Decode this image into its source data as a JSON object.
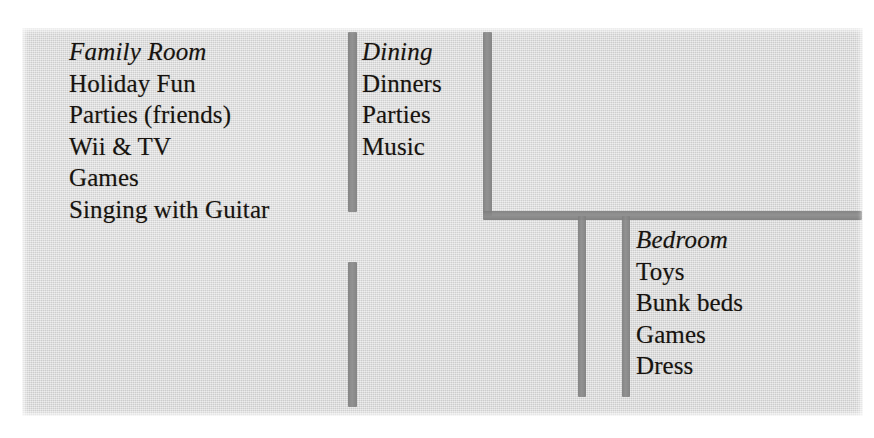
{
  "page": {
    "kind": "scanned-floorplan-notes",
    "paper_color": "#d9d9d9",
    "ink_color": "#17130f",
    "wall_color": "#8c8c8c"
  },
  "rooms": [
    {
      "id": "family-room",
      "title": "Family Room",
      "items": [
        "Holiday Fun",
        "Parties (friends)",
        "Wii & TV",
        "Games",
        "Singing with Guitar"
      ]
    },
    {
      "id": "dining",
      "title": "Dining",
      "items": [
        "Dinners",
        "Parties",
        "Music"
      ]
    },
    {
      "id": "bedroom",
      "title": "Bedroom",
      "items": [
        "Toys",
        "Bunk beds",
        "Games",
        "Dress"
      ]
    }
  ]
}
